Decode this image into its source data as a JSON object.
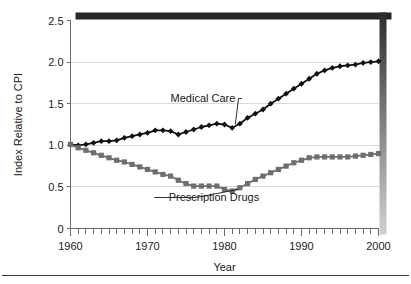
{
  "figure": {
    "background_color": "#ffffff",
    "frame": {
      "top_border_color": "#262626",
      "shadow_top_color": "#2b2b2b",
      "shadow_bottom_color": "#d0d0d0",
      "bottom_rule_color": "#3a3a3a"
    }
  },
  "chart_data": {
    "type": "line",
    "title": "",
    "subtitle": "",
    "xlabel": "Year",
    "ylabel": "Index Relative to CPI",
    "xlim": [
      1960,
      2000
    ],
    "ylim": [
      0,
      2.5
    ],
    "grid": true,
    "gridlines_y": [
      0.5,
      1.0,
      1.5,
      2.0
    ],
    "legend_position": "inline-annotations",
    "x_tick_labels": [
      "1960",
      "1970",
      "1980",
      "1990",
      "2000"
    ],
    "x_major_ticks": [
      1960,
      1970,
      1980,
      1990,
      2000
    ],
    "x_minor_tick_interval": 1,
    "y_tick_labels": [
      "0",
      "0.5",
      "1.0",
      "1.5",
      "2.0",
      "2.5"
    ],
    "y_ticks": [
      0,
      0.5,
      1.0,
      1.5,
      2.0,
      2.5
    ],
    "x": [
      1960,
      1961,
      1962,
      1963,
      1964,
      1965,
      1966,
      1967,
      1968,
      1969,
      1970,
      1971,
      1972,
      1973,
      1974,
      1975,
      1976,
      1977,
      1978,
      1979,
      1980,
      1981,
      1982,
      1983,
      1984,
      1985,
      1986,
      1987,
      1988,
      1989,
      1990,
      1991,
      1992,
      1993,
      1994,
      1995,
      1996,
      1997,
      1998,
      1999,
      2000
    ],
    "series": [
      {
        "name": "Medical Care",
        "marker": "diamond",
        "color": "#111111",
        "annotation": "Medical Care",
        "values": [
          1.01,
          1.0,
          1.01,
          1.03,
          1.05,
          1.05,
          1.06,
          1.09,
          1.11,
          1.13,
          1.15,
          1.18,
          1.18,
          1.17,
          1.13,
          1.16,
          1.19,
          1.22,
          1.24,
          1.26,
          1.25,
          1.21,
          1.26,
          1.33,
          1.38,
          1.43,
          1.5,
          1.56,
          1.62,
          1.68,
          1.74,
          1.8,
          1.86,
          1.9,
          1.93,
          1.95,
          1.96,
          1.97,
          1.99,
          2.0,
          2.01
        ]
      },
      {
        "name": "Prescription Drugs",
        "marker": "square",
        "color": "#6e6e6e",
        "annotation": "Prescription Drugs",
        "values": [
          1.01,
          0.97,
          0.94,
          0.91,
          0.88,
          0.85,
          0.82,
          0.8,
          0.77,
          0.74,
          0.71,
          0.68,
          0.65,
          0.63,
          0.58,
          0.54,
          0.51,
          0.51,
          0.51,
          0.51,
          0.47,
          0.45,
          0.49,
          0.54,
          0.59,
          0.63,
          0.67,
          0.71,
          0.75,
          0.79,
          0.82,
          0.85,
          0.86,
          0.86,
          0.86,
          0.86,
          0.86,
          0.87,
          0.88,
          0.89,
          0.9
        ]
      }
    ],
    "annotations": [
      {
        "text": "Medical Care",
        "x": 1973.0,
        "y": 1.52,
        "leader_to_x": 1981.4,
        "leader_to_y": 1.25
      },
      {
        "text": "Prescription Drugs",
        "x": 1984.5,
        "y": 0.33,
        "leader_to_x": 1981.8,
        "leader_to_y": 0.47
      }
    ]
  }
}
